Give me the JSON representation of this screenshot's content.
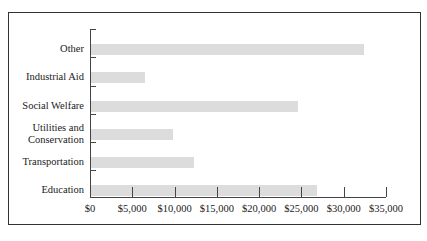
{
  "chart_data": {
    "type": "bar",
    "orientation": "horizontal",
    "title": "",
    "xlabel": "",
    "ylabel": "",
    "categories": [
      "Other",
      "Industrial Aid",
      "Social Welfare",
      "Utilities and Conservation",
      "Transportation",
      "Education"
    ],
    "category_label_lines": [
      [
        "Other"
      ],
      [
        "Industrial Aid"
      ],
      [
        "Social Welfare"
      ],
      [
        "Utilities and",
        "Conservation"
      ],
      [
        "Transportation"
      ],
      [
        "Education"
      ]
    ],
    "values": [
      32300,
      6400,
      24500,
      9700,
      12200,
      26700
    ],
    "xlim": [
      0,
      35000
    ],
    "x_ticks": [
      0,
      5000,
      10000,
      15000,
      20000,
      25000,
      30000,
      35000
    ],
    "x_tick_labels": [
      "$0",
      "$5,000",
      "$10,000",
      "$15,000",
      "$20,000",
      "$25,000",
      "$30,000",
      "$35,000"
    ],
    "grid": false,
    "legend": null,
    "bar_color": "#dcdcdc"
  }
}
